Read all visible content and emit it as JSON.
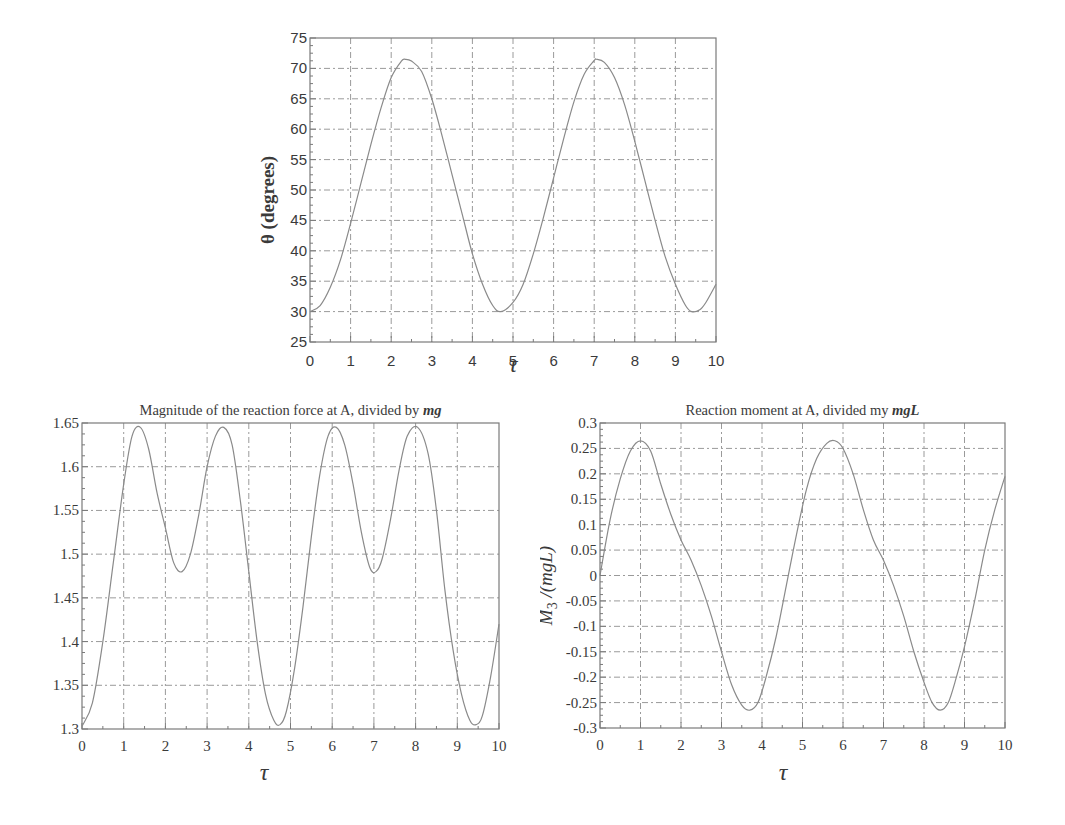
{
  "chart_data": [
    {
      "id": "theta",
      "type": "line",
      "title": "",
      "xlabel": "τ",
      "ylabel": "θ (degrees)",
      "xlim": [
        0,
        10
      ],
      "ylim": [
        25,
        75
      ],
      "xticks": [
        0,
        1,
        2,
        3,
        4,
        5,
        6,
        7,
        8,
        9,
        10
      ],
      "yticks": [
        25,
        30,
        35,
        40,
        45,
        50,
        55,
        60,
        65,
        70,
        75
      ],
      "ytick_labels": [
        "25",
        "30",
        "35",
        "40",
        "45",
        "50",
        "55",
        "60",
        "65",
        "70",
        "75"
      ],
      "grid": true,
      "legend": null,
      "series": [
        {
          "name": "theta",
          "x": [
            0,
            0.25,
            0.5,
            0.75,
            1,
            1.25,
            1.5,
            1.75,
            2,
            2.25,
            2.35,
            2.5,
            2.75,
            3,
            3.25,
            3.5,
            3.75,
            4,
            4.25,
            4.5,
            4.7,
            5,
            5.25,
            5.5,
            5.75,
            6,
            6.25,
            6.5,
            6.75,
            7,
            7.05,
            7.25,
            7.5,
            7.75,
            8,
            8.25,
            8.5,
            8.75,
            9,
            9.25,
            9.4,
            9.6,
            9.75,
            10
          ],
          "y": [
            30,
            31,
            34,
            38.5,
            44.5,
            51,
            57.5,
            63.5,
            68.5,
            71.2,
            71.5,
            71.2,
            69.5,
            65,
            59,
            52.5,
            46,
            39.5,
            34.5,
            31,
            30,
            31.5,
            34.5,
            39.5,
            45.5,
            52,
            58.5,
            64.5,
            69,
            71.3,
            71.5,
            71,
            68.5,
            64,
            58,
            51.5,
            45,
            39,
            34.5,
            31,
            30,
            30.3,
            31.5,
            34.5
          ]
        }
      ]
    },
    {
      "id": "force",
      "type": "line",
      "title": "Magnitude of the reaction force at A, divided by ",
      "title_italic": "mg",
      "xlabel": "τ",
      "ylabel": "",
      "xlim": [
        0,
        10
      ],
      "ylim": [
        1.3,
        1.65
      ],
      "xticks": [
        0,
        1,
        2,
        3,
        4,
        5,
        6,
        7,
        8,
        9,
        10
      ],
      "yticks": [
        1.3,
        1.35,
        1.4,
        1.45,
        1.5,
        1.55,
        1.6,
        1.65
      ],
      "ytick_labels": [
        "1.3",
        "1.35",
        "1.4",
        "1.45",
        "1.5",
        "1.55",
        "1.6",
        "1.65"
      ],
      "grid": true,
      "legend": null,
      "series": [
        {
          "name": "reaction force / mg",
          "x": [
            0,
            0.25,
            0.5,
            0.75,
            1,
            1.2,
            1.4,
            1.6,
            1.8,
            2,
            2.2,
            2.4,
            2.6,
            2.8,
            3,
            3.2,
            3.4,
            3.6,
            3.8,
            4,
            4.2,
            4.4,
            4.6,
            4.75,
            4.9,
            5.1,
            5.3,
            5.5,
            5.7,
            5.9,
            6.1,
            6.3,
            6.5,
            6.7,
            6.9,
            7.05,
            7.2,
            7.4,
            7.6,
            7.8,
            8.05,
            8.3,
            8.5,
            8.7,
            8.9,
            9.1,
            9.3,
            9.45,
            9.6,
            9.8,
            10
          ],
          "y": [
            1.303,
            1.33,
            1.4,
            1.49,
            1.58,
            1.635,
            1.645,
            1.62,
            1.57,
            1.53,
            1.49,
            1.48,
            1.5,
            1.545,
            1.6,
            1.635,
            1.645,
            1.625,
            1.56,
            1.48,
            1.4,
            1.34,
            1.31,
            1.305,
            1.32,
            1.37,
            1.44,
            1.52,
            1.59,
            1.635,
            1.645,
            1.625,
            1.58,
            1.525,
            1.485,
            1.48,
            1.495,
            1.54,
            1.595,
            1.635,
            1.645,
            1.615,
            1.55,
            1.46,
            1.39,
            1.34,
            1.31,
            1.305,
            1.315,
            1.36,
            1.42
          ]
        }
      ]
    },
    {
      "id": "moment",
      "type": "line",
      "title": "Reaction moment at A, divided my ",
      "title_italic": "mgL",
      "xlabel": "τ",
      "ylabel": "M3 /(mgL)",
      "ylabel_main": "M",
      "ylabel_sub": "3",
      "ylabel_rest": " /(mgL)",
      "xlim": [
        0,
        10
      ],
      "ylim": [
        -0.3,
        0.3
      ],
      "xticks": [
        0,
        1,
        2,
        3,
        4,
        5,
        6,
        7,
        8,
        9,
        10
      ],
      "yticks": [
        -0.3,
        -0.25,
        -0.2,
        -0.15,
        -0.1,
        -0.05,
        0,
        0.05,
        0.1,
        0.15,
        0.2,
        0.25,
        0.3
      ],
      "ytick_labels": [
        "-0.3",
        "-0.25",
        "-0.2",
        "-0.15",
        "-0.1",
        "-0.05",
        "0",
        "0.05",
        "0.1",
        "0.15",
        "0.2",
        "0.25",
        "0.3"
      ],
      "grid": true,
      "legend": null,
      "series": [
        {
          "name": "M3/(mgL)",
          "x": [
            0,
            0.25,
            0.5,
            0.75,
            1,
            1.25,
            1.5,
            1.75,
            2,
            2.25,
            2.5,
            2.75,
            3,
            3.25,
            3.5,
            3.7,
            3.9,
            4.1,
            4.35,
            4.6,
            4.85,
            5.1,
            5.35,
            5.6,
            5.8,
            6,
            6.25,
            6.5,
            6.75,
            7,
            7.25,
            7.5,
            7.75,
            8,
            8.2,
            8.4,
            8.6,
            8.8,
            9,
            9.25,
            9.5,
            9.75,
            10
          ],
          "y": [
            0,
            0.11,
            0.19,
            0.245,
            0.265,
            0.245,
            0.18,
            0.12,
            0.07,
            0.03,
            -0.02,
            -0.08,
            -0.15,
            -0.215,
            -0.255,
            -0.265,
            -0.25,
            -0.2,
            -0.12,
            -0.02,
            0.08,
            0.17,
            0.23,
            0.26,
            0.265,
            0.25,
            0.2,
            0.13,
            0.07,
            0.03,
            -0.02,
            -0.08,
            -0.15,
            -0.21,
            -0.25,
            -0.265,
            -0.25,
            -0.2,
            -0.14,
            -0.05,
            0.05,
            0.13,
            0.195
          ]
        }
      ]
    }
  ],
  "style": {
    "line_color": "#8a8a8a",
    "grid_color": "#9a9a9a",
    "axis_color": "#7a7a7a",
    "text_color": "#3a3a3a"
  }
}
